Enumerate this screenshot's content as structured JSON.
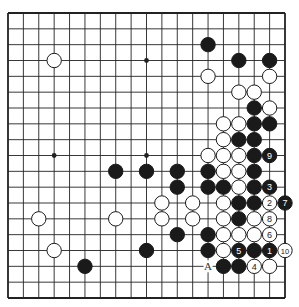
{
  "board": {
    "size": 19,
    "line_color": "#222222",
    "black_color": "#1a1a1a",
    "white_color": "#ffffff",
    "hoshi": [
      [
        3,
        3
      ],
      [
        9,
        3
      ],
      [
        15,
        3
      ],
      [
        3,
        9
      ],
      [
        9,
        9
      ],
      [
        15,
        9
      ],
      [
        3,
        15
      ],
      [
        9,
        15
      ],
      [
        15,
        15
      ]
    ],
    "black_stones": [
      [
        13,
        2
      ],
      [
        15,
        3
      ],
      [
        17,
        3
      ],
      [
        16,
        6
      ],
      [
        16,
        7
      ],
      [
        17,
        7
      ],
      [
        15,
        8
      ],
      [
        16,
        8
      ],
      [
        16,
        9
      ],
      [
        7,
        10
      ],
      [
        9,
        10
      ],
      [
        11,
        10
      ],
      [
        13,
        10
      ],
      [
        16,
        10
      ],
      [
        11,
        11
      ],
      [
        13,
        11
      ],
      [
        14,
        11
      ],
      [
        16,
        11
      ],
      [
        15,
        12
      ],
      [
        16,
        12
      ],
      [
        15,
        13
      ],
      [
        11,
        14
      ],
      [
        13,
        14
      ],
      [
        9,
        15
      ],
      [
        13,
        15
      ],
      [
        16,
        15
      ],
      [
        5,
        16
      ],
      [
        14,
        16
      ],
      [
        15,
        16
      ]
    ],
    "white_stones": [
      [
        3,
        3
      ],
      [
        13,
        4
      ],
      [
        17,
        4
      ],
      [
        15,
        5
      ],
      [
        16,
        5
      ],
      [
        17,
        6
      ],
      [
        14,
        7
      ],
      [
        15,
        7
      ],
      [
        14,
        8
      ],
      [
        13,
        9
      ],
      [
        14,
        9
      ],
      [
        15,
        9
      ],
      [
        14,
        10
      ],
      [
        15,
        10
      ],
      [
        15,
        11
      ],
      [
        10,
        12
      ],
      [
        12,
        12
      ],
      [
        14,
        12
      ],
      [
        2,
        13
      ],
      [
        7,
        13
      ],
      [
        10,
        13
      ],
      [
        12,
        13
      ],
      [
        14,
        13
      ],
      [
        16,
        13
      ],
      [
        14,
        14
      ],
      [
        15,
        14
      ],
      [
        16,
        14
      ],
      [
        3,
        15
      ],
      [
        14,
        15
      ],
      [
        17,
        16
      ]
    ],
    "numbered_moves": [
      {
        "n": "1",
        "color": "black",
        "pos": [
          17,
          15
        ]
      },
      {
        "n": "2",
        "color": "white",
        "pos": [
          17,
          12
        ]
      },
      {
        "n": "3",
        "color": "black",
        "pos": [
          17,
          11
        ]
      },
      {
        "n": "4",
        "color": "white",
        "pos": [
          16,
          16
        ]
      },
      {
        "n": "5",
        "color": "black",
        "pos": [
          15,
          15
        ]
      },
      {
        "n": "6",
        "color": "white",
        "pos": [
          17,
          14
        ]
      },
      {
        "n": "7",
        "color": "black",
        "pos": [
          18,
          12
        ]
      },
      {
        "n": "8",
        "color": "white",
        "pos": [
          17,
          13
        ]
      },
      {
        "n": "9",
        "color": "black",
        "pos": [
          17,
          9
        ]
      },
      {
        "n": "10",
        "color": "white",
        "pos": [
          18,
          15
        ]
      }
    ],
    "labels": [
      {
        "text": "A",
        "pos": [
          13,
          16
        ]
      }
    ]
  }
}
